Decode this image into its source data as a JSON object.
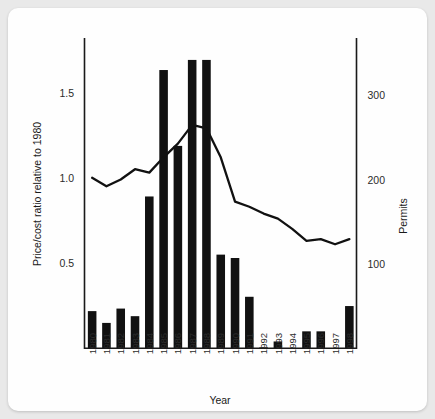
{
  "chart_data": {
    "type": "bar",
    "title": "",
    "subtitle": "",
    "xlabel": "Year",
    "ylabel": "Price/cost ratio relative to 1980",
    "y2label": "Permits",
    "grid": false,
    "legend": "none",
    "categories": [
      "1980",
      "1981",
      "1982",
      "1983",
      "1984",
      "1985",
      "1986",
      "1987",
      "1988",
      "1989",
      "1990",
      "1991",
      "1992",
      "1993",
      "1994",
      "1995",
      "1996",
      "1997",
      "1998"
    ],
    "ylim": [
      0,
      1.82
    ],
    "yticks": [
      0.5,
      1.0,
      1.5
    ],
    "ytick_labels": [
      "0.5",
      "1.0",
      "1.5"
    ],
    "y2lim": [
      0,
      368
    ],
    "y2ticks": [
      100,
      200,
      300
    ],
    "y2tick_labels": [
      "100",
      "200",
      "300"
    ],
    "series": [
      {
        "name": "Permits",
        "type": "bar",
        "axis": "right",
        "values": [
          44,
          30,
          47,
          38,
          180,
          330,
          240,
          342,
          342,
          111,
          107,
          61,
          1,
          8,
          0,
          20,
          20,
          0,
          50
        ]
      },
      {
        "name": "Price/cost ratio relative to 1980",
        "type": "line",
        "axis": "left",
        "values": [
          1.0,
          0.95,
          0.99,
          1.05,
          1.03,
          1.12,
          1.2,
          1.31,
          1.29,
          1.12,
          0.86,
          0.83,
          0.79,
          0.76,
          0.7,
          0.63,
          0.64,
          0.61,
          0.64
        ]
      }
    ]
  },
  "axes": {
    "x_title": "Year",
    "y_left_title": "Price/cost ratio relative to 1980",
    "y_right_title": "Permits"
  },
  "colors": {
    "bar": "#111111",
    "line": "#111111",
    "axis": "#1a1a1a",
    "background": "#fefefe",
    "page": "#e9e9e9"
  }
}
